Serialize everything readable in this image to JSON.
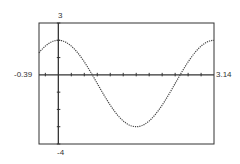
{
  "chart_data": {
    "type": "line",
    "title": "",
    "xlabel": "",
    "ylabel": "",
    "xlim": [
      -0.39,
      3.14
    ],
    "ylim": [
      -4,
      3
    ],
    "x_tick_spacing": 0.2618,
    "y_tick_spacing": 1,
    "grid": false,
    "window_labels": {
      "xmin": "-0.39",
      "xmax": "3.14",
      "ymax": "3",
      "ymin": "-4"
    },
    "series": [
      {
        "name": "curve",
        "style": "dotted",
        "function": "2.5*cos(2x) - 0.5",
        "x": [
          -0.39,
          0,
          0.39,
          0.69,
          0.79,
          1.18,
          1.57,
          1.96,
          2.36,
          2.45,
          2.75,
          3.14
        ],
        "y": [
          1.27,
          2.0,
          1.27,
          0.0,
          -0.5,
          -2.27,
          -3.0,
          -2.27,
          -0.5,
          0.0,
          1.27,
          2.0
        ]
      }
    ]
  }
}
